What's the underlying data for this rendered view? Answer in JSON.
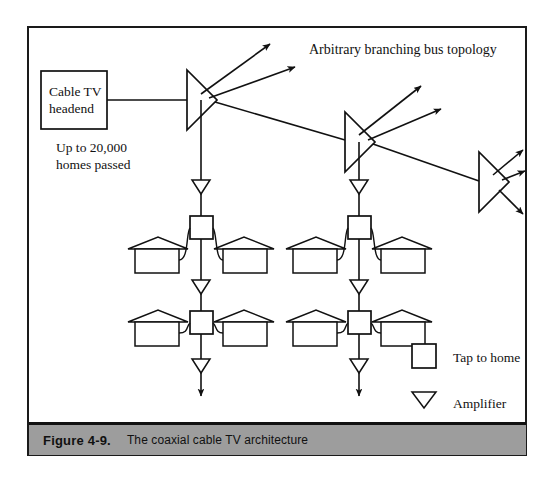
{
  "figure": {
    "caption_number": "Figure 4-9.",
    "caption_text": "The coaxial cable TV architecture",
    "caption_bar_color": "#9d9d9d",
    "border_color": "#1a1a1a",
    "background_color": "#ffffff"
  },
  "diagram": {
    "title": "Arbitrary branching bus topology",
    "headend": {
      "line1": "Cable TV",
      "line2": "headend"
    },
    "capacity_note": {
      "line1": "Up to 20,000",
      "line2": "homes passed"
    },
    "nodes": {
      "splitter_label": "splitter",
      "tap_label": "tap",
      "amplifier_label": "amplifier",
      "house_label": "home"
    },
    "counts": {
      "splitters": 3,
      "taps": 4,
      "houses": 8,
      "amplifiers": 8,
      "feeder_lines": 2
    }
  },
  "legend": {
    "items": [
      {
        "symbol": "square",
        "label": "Tap to home"
      },
      {
        "symbol": "down-triangle",
        "label": "Amplifier"
      }
    ]
  }
}
